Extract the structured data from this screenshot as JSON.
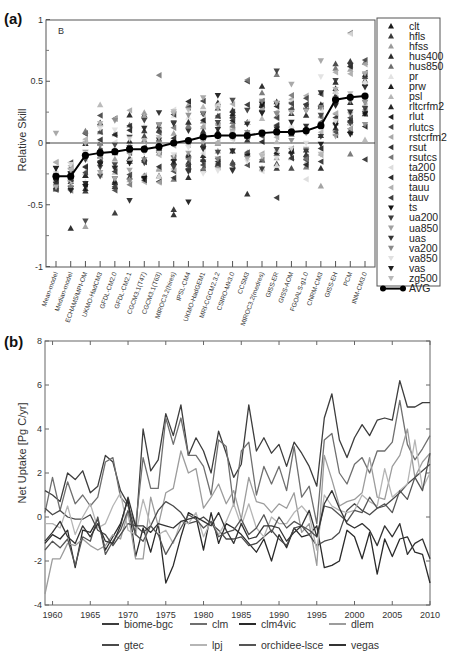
{
  "chart_data": [
    {
      "panel": "(a)",
      "type": "scatter",
      "annotation": "B",
      "title": "",
      "xlabel": "",
      "ylabel": "Relative Skill",
      "ylim": [
        -1,
        1
      ],
      "yticks": [
        "1",
        "0.5",
        "0",
        "-0.5",
        "-1"
      ],
      "grid": false,
      "legend_position": "right-outside",
      "categories": [
        "Mean-model",
        "Median-model",
        "ECHAM5/MPI-OM",
        "UKMO-HadCM3",
        "GFDL-CM2.0",
        "GFDL-CM2.1",
        "CGCM3.1(T47)",
        "CGCM3.1(T63)",
        "MIROC3.2(hires)",
        "IPSL-CM4",
        "UKMO-HadGEM1",
        "MRI-CGCM2.3.2",
        "CSIRO-Mk3.0",
        "CCSM3",
        "MIROC3.2(medres)",
        "GISS-ER",
        "GISS-AOM",
        "FGOALS-g1.0",
        "CNRM-CM3",
        "GISS-EH",
        "PCM",
        "INM-CM3.0"
      ],
      "avg_series": {
        "name": "AVG",
        "values": [
          -0.27,
          -0.27,
          -0.1,
          -0.08,
          -0.07,
          -0.05,
          -0.05,
          -0.03,
          0.0,
          0.02,
          0.05,
          0.06,
          0.06,
          0.06,
          0.08,
          0.09,
          0.09,
          0.1,
          0.14,
          0.35,
          0.37,
          0.38
        ]
      },
      "legend": [
        {
          "name": "clt",
          "marker": "up",
          "color": "#1a1a1a"
        },
        {
          "name": "hfls",
          "marker": "up",
          "color": "#3a3a3a"
        },
        {
          "name": "hfss",
          "marker": "up",
          "color": "#9a9a9a"
        },
        {
          "name": "hus400",
          "marker": "up",
          "color": "#2a2a2a"
        },
        {
          "name": "hus850",
          "marker": "up",
          "color": "#6e6e6e"
        },
        {
          "name": "pr",
          "marker": "up",
          "color": "#e2e2e2"
        },
        {
          "name": "prw",
          "marker": "up",
          "color": "#1e1e1e"
        },
        {
          "name": "psl",
          "marker": "up",
          "color": "#b4b4b4"
        },
        {
          "name": "rltcrfm2",
          "marker": "up",
          "color": "#262626"
        },
        {
          "name": "rlut",
          "marker": "left",
          "color": "#1e1e1e"
        },
        {
          "name": "rlutcs",
          "marker": "left",
          "color": "#444444"
        },
        {
          "name": "rstcrfm2",
          "marker": "left",
          "color": "#a8a8a8"
        },
        {
          "name": "rsut",
          "marker": "left",
          "color": "#333333"
        },
        {
          "name": "rsutcs",
          "marker": "left",
          "color": "#777777"
        },
        {
          "name": "ta200",
          "marker": "left",
          "color": "#dcdcdc"
        },
        {
          "name": "ta850",
          "marker": "left",
          "color": "#2b2b2b"
        },
        {
          "name": "tauu",
          "marker": "left",
          "color": "#b0b0b0"
        },
        {
          "name": "tauv",
          "marker": "left",
          "color": "#404040"
        },
        {
          "name": "ts",
          "marker": "down",
          "color": "#111111"
        },
        {
          "name": "ua200",
          "marker": "down",
          "color": "#3c3c3c"
        },
        {
          "name": "ua850",
          "marker": "down",
          "color": "#a0a0a0"
        },
        {
          "name": "uas",
          "marker": "down",
          "color": "#333333"
        },
        {
          "name": "va200",
          "marker": "down",
          "color": "#8a8a8a"
        },
        {
          "name": "va850",
          "marker": "down",
          "color": "#e0e0e0"
        },
        {
          "name": "vas",
          "marker": "down",
          "color": "#1f1f1f"
        },
        {
          "name": "zg500",
          "marker": "down",
          "color": "#b8b8b8"
        },
        {
          "name": "AVG",
          "marker": "line-dot",
          "color": "#000000"
        }
      ],
      "scatter_note": "Per-variable marker values are synthetic. Only the AVG line was read from the image. Individual scatter points are generated client-side with a seeded PRNG and clamped to [-1,1]; they are placeholders, not measured data."
    },
    {
      "panel": "(b)",
      "type": "line",
      "title": "",
      "xlabel": "",
      "ylabel": "Net Uptake [Pg C/yr]",
      "xlim": [
        1959,
        2010
      ],
      "ylim": [
        -4,
        8
      ],
      "xticks": [
        "1960",
        "1965",
        "1970",
        "1975",
        "1980",
        "1985",
        "1990",
        "1995",
        "2000",
        "2005",
        "2010"
      ],
      "yticks": [
        "8",
        "6",
        "4",
        "2",
        "0",
        "-2",
        "-4"
      ],
      "grid": false,
      "legend_position": "bottom",
      "values_note": "Approximate. Series overlap heavily and could not be traced individually; shapes roughly follow visible peaks and troughs.",
      "x": [
        1959,
        1960,
        1961,
        1962,
        1963,
        1964,
        1965,
        1966,
        1967,
        1968,
        1969,
        1970,
        1971,
        1972,
        1973,
        1974,
        1975,
        1976,
        1977,
        1978,
        1979,
        1980,
        1981,
        1982,
        1983,
        1984,
        1985,
        1986,
        1987,
        1988,
        1989,
        1990,
        1991,
        1992,
        1993,
        1994,
        1995,
        1996,
        1997,
        1998,
        1999,
        2000,
        2001,
        2002,
        2003,
        2004,
        2005,
        2006,
        2007,
        2008,
        2009,
        2010
      ],
      "series": [
        {
          "name": "biome-bgc",
          "color": "#3d3d3d",
          "values": [
            1.2,
            1.0,
            0.7,
            2.0,
            1.7,
            2.1,
            1.1,
            1.4,
            2.8,
            2.5,
            1.2,
            0.6,
            -0.8,
            4.0,
            2.1,
            2.6,
            4.7,
            3.7,
            5.1,
            2.8,
            3.6,
            3.0,
            2.0,
            3.9,
            2.9,
            1.8,
            2.4,
            5.1,
            3.0,
            3.6,
            2.9,
            3.3,
            2.3,
            3.4,
            2.9,
            2.3,
            1.4,
            4.5,
            5.6,
            3.5,
            2.7,
            3.6,
            4.2,
            3.7,
            4.4,
            4.5,
            4.4,
            6.2,
            5.0,
            5.0,
            5.2,
            5.2
          ]
        },
        {
          "name": "clm",
          "color": "#6f6f6f",
          "values": [
            0.2,
            1.8,
            0.3,
            1.6,
            0.6,
            1.0,
            0.5,
            0.9,
            2.5,
            2.7,
            0.9,
            0.5,
            -0.4,
            2.7,
            1.3,
            1.3,
            4.5,
            3.3,
            4.5,
            2.8,
            2.8,
            2.3,
            1.0,
            3.5,
            3.2,
            0.5,
            3.0,
            3.4,
            1.0,
            2.3,
            1.5,
            2.3,
            1.2,
            3.2,
            0.9,
            1.4,
            -0.3,
            3.5,
            3.8,
            2.0,
            1.5,
            2.4,
            2.7,
            2.0,
            3.0,
            3.0,
            3.4,
            5.3,
            3.3,
            2.6,
            3.1,
            3.7
          ]
        },
        {
          "name": "clm4vic",
          "color": "#2a2a2a",
          "values": [
            -1.2,
            -0.8,
            -1.0,
            -0.6,
            -2.3,
            -0.6,
            -0.7,
            -0.1,
            -1.5,
            -0.9,
            -0.3,
            0.8,
            -1.8,
            -0.5,
            -1.6,
            -0.3,
            -3.0,
            -2.2,
            -0.9,
            0.2,
            0.0,
            -1.5,
            0.2,
            -1.2,
            -0.3,
            -0.5,
            -0.8,
            -1.2,
            -1.6,
            -1.0,
            -2.0,
            -0.8,
            -1.4,
            -0.5,
            -0.9,
            -0.8,
            -0.4,
            -2.3,
            -2.2,
            -2.0,
            -0.6,
            -0.9,
            -1.9,
            -0.7,
            -2.6,
            -1.0,
            -1.8,
            -1.0,
            -0.9,
            -1.6,
            -1.7,
            -3.0
          ]
        },
        {
          "name": "dlem",
          "color": "#9c9c9c",
          "values": [
            -3.5,
            -1.9,
            -1.9,
            -1.2,
            -1.3,
            -1.0,
            -1.3,
            -1.5,
            -1.3,
            -0.8,
            -1.0,
            0.2,
            -1.9,
            -1.9,
            0.9,
            -0.4,
            1.1,
            1.3,
            3.0,
            2.0,
            2.2,
            0.4,
            0.9,
            1.5,
            0.6,
            1.2,
            -0.1,
            1.8,
            0.7,
            0.6,
            0.2,
            0.6,
            0.4,
            1.1,
            -0.7,
            -0.3,
            -2.2,
            2.8,
            1.7,
            0.5,
            0.7,
            0.8,
            1.1,
            2.7,
            0.9,
            0.8,
            2.3,
            2.8,
            4.0,
            1.8,
            2.5,
            2.9
          ]
        },
        {
          "name": "gtec",
          "color": "#4a4a4a",
          "values": [
            0.4,
            0.1,
            0.3,
            0.0,
            -0.1,
            -0.1,
            0.1,
            -0.6,
            -0.8,
            -1.3,
            -0.8,
            -0.3,
            -0.4,
            -0.7,
            -0.4,
            0.3,
            0.7,
            0.5,
            0.2,
            -0.3,
            -0.2,
            0.0,
            -0.3,
            -0.6,
            -1.0,
            -1.0,
            -0.9,
            -1.3,
            -1.2,
            -0.9,
            -0.6,
            -1.0,
            -1.3,
            -0.5,
            -0.4,
            -0.8,
            -1.3,
            -1.1,
            -1.0,
            -0.7,
            0.3,
            0.6,
            0.3,
            0.1,
            0.4,
            0.5,
            0.8,
            1.1,
            1.5,
            1.8,
            2.1,
            2.4
          ]
        },
        {
          "name": "lpj",
          "color": "#b5b5b5",
          "values": [
            -0.3,
            -0.3,
            -0.5,
            0.5,
            -0.8,
            0.0,
            0.6,
            -0.5,
            -0.3,
            0.5,
            1.1,
            -0.6,
            -0.8,
            0.8,
            -0.4,
            -0.8,
            -0.6,
            -1.2,
            -0.2,
            -0.3,
            0.2,
            -0.9,
            -0.2,
            -0.8,
            -0.2,
            0.6,
            -0.4,
            0.6,
            -0.5,
            -0.9,
            0.0,
            -0.3,
            -0.3,
            0.2,
            0.5,
            0.1,
            -1.5,
            1.0,
            0.5,
            0.3,
            0.2,
            0.3,
            1.0,
            0.7,
            0.5,
            2.2,
            0.9,
            1.2,
            1.5,
            3.5,
            1.3,
            2.0
          ]
        },
        {
          "name": "orchidee-lsce",
          "color": "#555555",
          "values": [
            -1.5,
            -1.1,
            -1.4,
            -1.0,
            -2.2,
            -0.9,
            -1.1,
            0.0,
            -1.7,
            -1.1,
            -0.6,
            0.3,
            -0.8,
            -1.1,
            -0.4,
            -0.8,
            -1.7,
            -1.1,
            -0.5,
            0.1,
            -0.1,
            -0.5,
            -0.2,
            -0.9,
            -0.7,
            -0.6,
            -0.1,
            -0.8,
            -0.5,
            0.1,
            -0.7,
            0.0,
            -0.5,
            -0.2,
            -0.4,
            -0.6,
            -0.9,
            0.5,
            0.4,
            0.1,
            -0.2,
            0.3,
            0.2,
            0.9,
            0.4,
            0.6,
            0.2,
            1.2,
            0.8,
            1.8,
            1.2,
            2.9
          ]
        },
        {
          "name": "vegas",
          "color": "#333333",
          "values": [
            -1.1,
            -0.7,
            -0.2,
            -0.9,
            -1.2,
            -0.4,
            -0.9,
            -0.3,
            -1.1,
            -1.2,
            -0.4,
            0.9,
            -0.4,
            -0.4,
            -0.7,
            -0.3,
            -0.4,
            -0.5,
            -0.2,
            -0.1,
            0.0,
            -0.2,
            -0.4,
            0.2,
            -0.6,
            -1.2,
            -0.3,
            -1.0,
            -0.9,
            -0.4,
            -0.4,
            -0.5,
            -1.1,
            -0.7,
            -0.4,
            0.3,
            -0.9,
            0.6,
            1.2,
            0.4,
            -0.3,
            -0.5,
            -0.3,
            -0.6,
            -1.3,
            -0.4,
            -0.9,
            -0.3,
            -1.7,
            -1.2,
            -1.0,
            -1.9
          ]
        }
      ]
    }
  ]
}
